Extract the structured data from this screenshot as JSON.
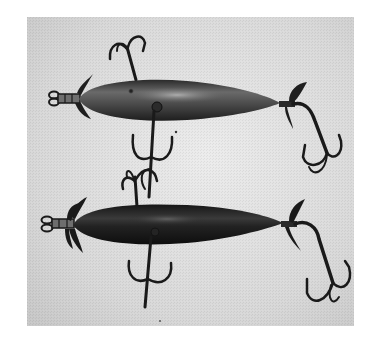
{
  "image": {
    "kind": "photograph",
    "color_mode": "grayscale",
    "subject": "two antique fishing lures",
    "alt": "Black and white photograph of two torpedo-shaped wooden fishing lures with propellers at each end and three treble hooks each, on a light textured background"
  },
  "colors": {
    "page_background": "#ffffff",
    "photo_background": "#d9d9d9",
    "photo_background_light": "#e6e6e6",
    "upper_lure_body": "#3a3a3a",
    "upper_lure_highlight": "#8a8a8a",
    "lower_lure_body": "#1c1c1c",
    "lower_lure_highlight": "#555555",
    "hardware": "#1a1a1a"
  },
  "objects": [
    {
      "name": "upper-lure",
      "body_shape": "torpedo",
      "tone": "medium-dark gray with glossy highlight",
      "features": [
        "front propeller",
        "screw-eye line tie",
        "painted eye",
        "belly treble hook (front, pointing up and down)",
        "tail propeller",
        "tail treble hook"
      ]
    },
    {
      "name": "lower-lure",
      "body_shape": "torpedo",
      "tone": "near-black",
      "features": [
        "front propeller",
        "screw-eye line tie",
        "belly treble hook",
        "tail propeller",
        "tail treble hook"
      ]
    }
  ]
}
